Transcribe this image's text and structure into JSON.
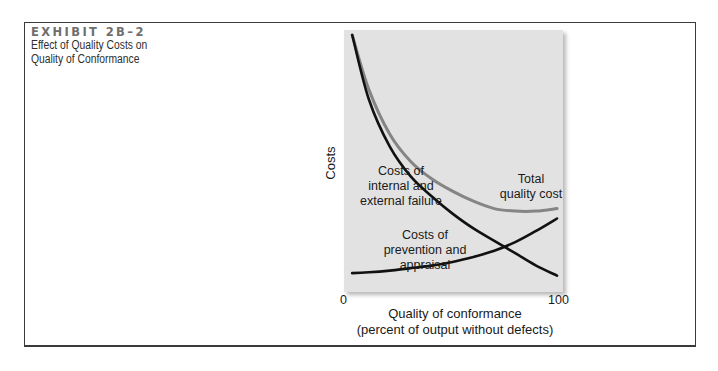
{
  "exhibit": {
    "label": "EXHIBIT 2B–2",
    "title_line1": "Effect of Quality Costs on",
    "title_line2": "Quality of Conformance"
  },
  "chart_data": {
    "type": "line",
    "title": "Effect of Quality Costs on Quality of Conformance",
    "xlabel": "Quality of conformance (percent of output without defects)",
    "xlabel_line1": "Quality of conformance",
    "xlabel_line2": "(percent of output without defects)",
    "ylabel": "Costs",
    "x_ticks": [
      "0",
      "100"
    ],
    "xlim": [
      0,
      100
    ],
    "y_ticks": [],
    "grid": false,
    "legend": "inline labels",
    "x": [
      2,
      10,
      20,
      30,
      40,
      50,
      60,
      70,
      80,
      90,
      100
    ],
    "series": [
      {
        "name": "Costs of internal and external failure",
        "label_lines": [
          "Costs of",
          "internal and",
          "external failure"
        ],
        "color": "#111111",
        "values": [
          100,
          74,
          55,
          43,
          35,
          28,
          22,
          17,
          12,
          7,
          3
        ]
      },
      {
        "name": "Costs of prevention and appraisal",
        "label_lines": [
          "Costs of",
          "prevention and",
          "appraisal"
        ],
        "color": "#111111",
        "values": [
          4,
          4.3,
          5,
          6,
          7,
          8.5,
          10.5,
          13,
          16.5,
          21,
          26
        ]
      },
      {
        "name": "Total quality cost",
        "label_lines": [
          "Total",
          "quality cost"
        ],
        "color": "#858585",
        "values": [
          100,
          78,
          60,
          49,
          42,
          37,
          33,
          30,
          29,
          29,
          30
        ]
      }
    ],
    "panel_background": "#e2e2e2"
  }
}
